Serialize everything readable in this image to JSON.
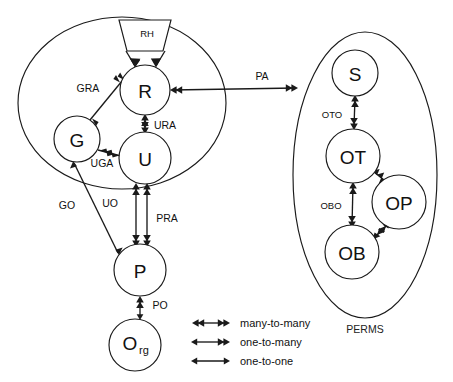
{
  "diagram": {
    "background_color": "#ffffff",
    "stroke_color": "#1a1a1a",
    "groups": [
      {
        "id": "left-group",
        "label": "",
        "shape": "ellipse",
        "cx": 122,
        "cy": 103,
        "rx": 104,
        "ry": 86
      },
      {
        "id": "perms-group",
        "label": "PERMS",
        "shape": "ellipse",
        "cx": 365,
        "cy": 175,
        "rx": 72,
        "ry": 143,
        "label_x": 365,
        "label_y": 329
      }
    ],
    "nodes": [
      {
        "id": "RH",
        "label": "RH",
        "shape": "trapezoid",
        "cx": 145,
        "cy": 37
      },
      {
        "id": "R",
        "label": "R",
        "shape": "circle",
        "cx": 145,
        "cy": 90,
        "r": 25
      },
      {
        "id": "G",
        "label": "G",
        "shape": "circle",
        "cx": 77,
        "cy": 139,
        "r": 23
      },
      {
        "id": "U",
        "label": "U",
        "shape": "circle",
        "cx": 145,
        "cy": 158,
        "r": 26
      },
      {
        "id": "P",
        "label": "P",
        "shape": "circle",
        "cx": 140,
        "cy": 270,
        "r": 26
      },
      {
        "id": "Org",
        "label": "O",
        "sublabel": "rg",
        "shape": "circle",
        "cx": 135,
        "cy": 345,
        "r": 26
      },
      {
        "id": "S",
        "label": "S",
        "shape": "circle",
        "cx": 355,
        "cy": 73,
        "r": 23
      },
      {
        "id": "OT",
        "label": "OT",
        "shape": "circle",
        "cx": 353,
        "cy": 156,
        "r": 27
      },
      {
        "id": "OP",
        "label": "OP",
        "shape": "circle",
        "cx": 399,
        "cy": 202,
        "r": 27
      },
      {
        "id": "OB",
        "label": "OB",
        "shape": "circle",
        "cx": 352,
        "cy": 252,
        "r": 27
      }
    ],
    "edges": [
      {
        "id": "rh-left",
        "label": "",
        "from": "RH",
        "to": "R",
        "cardinality": "one-to-one"
      },
      {
        "id": "rh-right",
        "label": "",
        "from": "RH",
        "to": "R",
        "cardinality": "one-to-one"
      },
      {
        "id": "gra",
        "label": "GRA",
        "from": "G",
        "to": "R",
        "cardinality": "many-to-many",
        "label_x": 88,
        "label_y": 88
      },
      {
        "id": "ura",
        "label": "URA",
        "from": "R",
        "to": "U",
        "cardinality": "many-to-many",
        "label_x": 165,
        "label_y": 125
      },
      {
        "id": "uga",
        "label": "UGA",
        "from": "G",
        "to": "U",
        "cardinality": "many-to-many",
        "label_x": 102,
        "label_y": 163
      },
      {
        "id": "pa",
        "label": "PA",
        "from": "R",
        "to": "PERMS",
        "cardinality": "many-to-many",
        "label_x": 262,
        "label_y": 76
      },
      {
        "id": "go",
        "label": "GO",
        "from": "P",
        "to": "G",
        "cardinality": "one-to-many",
        "label_x": 67,
        "label_y": 205
      },
      {
        "id": "uo",
        "label": "UO",
        "from": "U",
        "to": "P",
        "cardinality": "many-to-many",
        "label_x": 110,
        "label_y": 203
      },
      {
        "id": "pra",
        "label": "PRA",
        "from": "P",
        "to": "U",
        "cardinality": "many-to-many",
        "label_x": 167,
        "label_y": 218
      },
      {
        "id": "po",
        "label": "PO",
        "from": "Org",
        "to": "P",
        "cardinality": "one-to-many",
        "label_x": 160,
        "label_y": 305
      },
      {
        "id": "oto",
        "label": "OTO",
        "from": "S",
        "to": "OT",
        "cardinality": "many-to-many",
        "label_x": 332,
        "label_y": 114
      },
      {
        "id": "obo",
        "label": "OBO",
        "from": "OT",
        "to": "OB",
        "cardinality": "many-to-many",
        "label_x": 331,
        "label_y": 205
      },
      {
        "id": "ot-op",
        "label": "",
        "from": "OT",
        "to": "OP",
        "cardinality": "many-to-many"
      },
      {
        "id": "ob-op",
        "label": "",
        "from": "OB",
        "to": "OP",
        "cardinality": "many-to-many"
      }
    ],
    "legend": {
      "items": [
        {
          "id": "legend-many-to-many",
          "label": "many-to-many",
          "cardinality": "many-to-many",
          "y": 323
        },
        {
          "id": "legend-one-to-many",
          "label": "one-to-many",
          "cardinality": "one-to-many",
          "y": 342
        },
        {
          "id": "legend-one-to-one",
          "label": "one-to-one",
          "cardinality": "one-to-one",
          "y": 361
        }
      ],
      "line_x1": 192,
      "line_x2": 230,
      "text_x": 240
    }
  }
}
